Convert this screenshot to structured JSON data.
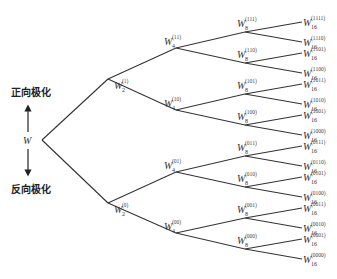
{
  "diagram": {
    "type": "binary-tree",
    "root": {
      "label": "W",
      "x": 42,
      "y": 140
    },
    "side_labels": {
      "positive": "正向极化",
      "negative": "反向极化"
    },
    "levels": [
      {
        "base": "W",
        "sub": "2",
        "x": 108,
        "nodes": [
          {
            "code": "(1)",
            "y": 79,
            "parent": 0
          },
          {
            "code": "(0)",
            "y": 203,
            "parent": 0
          }
        ]
      },
      {
        "base": "W",
        "sub": "4",
        "x": 176,
        "nodes": [
          {
            "code": "(11)",
            "y": 48,
            "parent": 0
          },
          {
            "code": "(10)",
            "y": 110,
            "parent": 0
          },
          {
            "code": "(01)",
            "y": 172,
            "parent": 1
          },
          {
            "code": "(00)",
            "y": 233,
            "parent": 1
          }
        ]
      },
      {
        "base": "W",
        "sub": "8",
        "x": 245,
        "nodes": [
          {
            "code": "(111)",
            "y": 32,
            "parent": 0
          },
          {
            "code": "(110)",
            "y": 63,
            "parent": 0
          },
          {
            "code": "(101)",
            "y": 94,
            "parent": 1
          },
          {
            "code": "(100)",
            "y": 125,
            "parent": 1
          },
          {
            "code": "(011)",
            "y": 156,
            "parent": 2
          },
          {
            "code": "(010)",
            "y": 187,
            "parent": 2
          },
          {
            "code": "(001)",
            "y": 218,
            "parent": 3
          },
          {
            "code": "(000)",
            "y": 249,
            "parent": 3
          }
        ]
      },
      {
        "base": "W",
        "sub": "16",
        "x": 302,
        "nodes": [
          {
            "code": "(1111)",
            "y": 22,
            "parent": 0
          },
          {
            "code": "(1110)",
            "y": 42,
            "parent": 0
          },
          {
            "code": "(1101)",
            "y": 53,
            "parent": 1
          },
          {
            "code": "(1100)",
            "y": 73,
            "parent": 1
          },
          {
            "code": "(1011)",
            "y": 84,
            "parent": 2
          },
          {
            "code": "(1010)",
            "y": 104,
            "parent": 2
          },
          {
            "code": "(1001)",
            "y": 115,
            "parent": 3
          },
          {
            "code": "(1000)",
            "y": 135,
            "parent": 3
          },
          {
            "code": "(0111)",
            "y": 146,
            "parent": 4
          },
          {
            "code": "(0110)",
            "y": 166,
            "parent": 4
          },
          {
            "code": "(0101)",
            "y": 177,
            "parent": 5
          },
          {
            "code": "(0100)",
            "y": 197,
            "parent": 5
          },
          {
            "code": "(0011)",
            "y": 208,
            "parent": 6
          },
          {
            "code": "(0010)",
            "y": 228,
            "parent": 6
          },
          {
            "code": "(0001)",
            "y": 239,
            "parent": 7
          },
          {
            "code": "(0000)",
            "y": 259,
            "parent": 7
          }
        ]
      }
    ]
  }
}
